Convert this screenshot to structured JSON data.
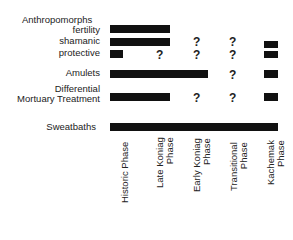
{
  "rows": {
    "anthropomorphs": "Anthropomorphs",
    "fertility": "fertility",
    "shamanic": "shamanic",
    "protective": "protective",
    "amulets": "Amulets",
    "dmt_line1": "Differential",
    "dmt_line2": "Mortuary Treatment",
    "sweatbaths": "Sweatbaths"
  },
  "columns": {
    "historic": [
      "Historic Phase"
    ],
    "late_koniag": [
      "Late Koniag",
      "Phase"
    ],
    "early_koniag": [
      "Early Koniag",
      "Phase"
    ],
    "transitional": [
      "Transitional",
      "Phase"
    ],
    "kachemak": [
      "Kachemak",
      "Phase"
    ]
  },
  "unknown_mark": "?"
}
